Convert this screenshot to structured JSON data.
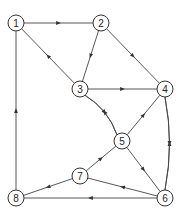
{
  "diagram": {
    "type": "directed-graph",
    "nodes": [
      {
        "id": "1",
        "label": "1",
        "x": 16,
        "y": 23
      },
      {
        "id": "2",
        "label": "2",
        "x": 101,
        "y": 23
      },
      {
        "id": "3",
        "label": "3",
        "x": 80,
        "y": 89
      },
      {
        "id": "4",
        "label": "4",
        "x": 165,
        "y": 89
      },
      {
        "id": "5",
        "label": "5",
        "x": 122,
        "y": 141
      },
      {
        "id": "6",
        "label": "6",
        "x": 165,
        "y": 198
      },
      {
        "id": "7",
        "label": "7",
        "x": 80,
        "y": 176
      },
      {
        "id": "8",
        "label": "8",
        "x": 16,
        "y": 198
      }
    ],
    "edges": [
      {
        "from": "1",
        "to": "2"
      },
      {
        "from": "3",
        "to": "1"
      },
      {
        "from": "8",
        "to": "1"
      },
      {
        "from": "2",
        "to": "3"
      },
      {
        "from": "2",
        "to": "4"
      },
      {
        "from": "3",
        "to": "4"
      },
      {
        "from": "3",
        "to": "5",
        "curve": "right"
      },
      {
        "from": "5",
        "to": "3",
        "curve": "left"
      },
      {
        "from": "5",
        "to": "4"
      },
      {
        "from": "4",
        "to": "6",
        "curve": "right"
      },
      {
        "from": "6",
        "to": "4",
        "curve": "left"
      },
      {
        "from": "5",
        "to": "6"
      },
      {
        "from": "7",
        "to": "5"
      },
      {
        "from": "6",
        "to": "7"
      },
      {
        "from": "7",
        "to": "8"
      },
      {
        "from": "6",
        "to": "8"
      }
    ]
  }
}
